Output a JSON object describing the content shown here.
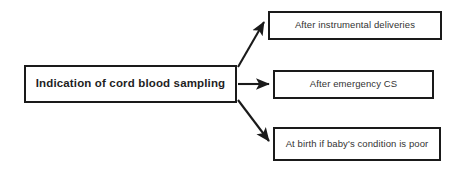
{
  "diagram": {
    "title": "Indication of cord blood sampling",
    "type": "flowchart",
    "orientation": "left-to-right",
    "background_color": "#ffffff",
    "line_color": "#1a1a1a",
    "text_color": "#2b2b2b",
    "root": {
      "label": "Indication of cord blood sampling",
      "emphasis": "bold"
    },
    "branches": [
      {
        "label": "After instrumental deliveries",
        "connector": "arrow-up-right",
        "arrow_name": "arrow-to-instrumental-deliveries"
      },
      {
        "label": "After emergency CS",
        "connector": "arrow-right",
        "arrow_name": "arrow-to-emergency-cs"
      },
      {
        "label": "At birth if baby's condition is poor",
        "connector": "arrow-down-right",
        "arrow_name": "arrow-to-poor-condition"
      }
    ]
  }
}
